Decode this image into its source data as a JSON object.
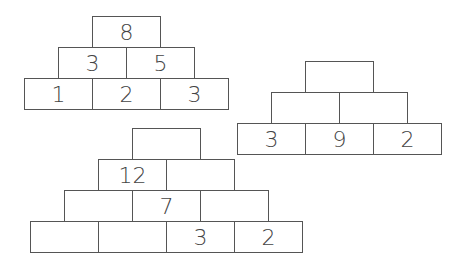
{
  "pyramids": [
    {
      "name": "pyramid-1",
      "rows": [
        [
          "8"
        ],
        [
          "3",
          "5"
        ],
        [
          "1",
          "2",
          "3"
        ]
      ]
    },
    {
      "name": "pyramid-2",
      "rows": [
        [
          ""
        ],
        [
          "",
          ""
        ],
        [
          "3",
          "9",
          "2"
        ]
      ]
    },
    {
      "name": "pyramid-3",
      "rows": [
        [
          ""
        ],
        [
          "12",
          ""
        ],
        [
          "",
          "7",
          ""
        ],
        [
          "",
          "",
          "3",
          "2"
        ]
      ]
    }
  ]
}
